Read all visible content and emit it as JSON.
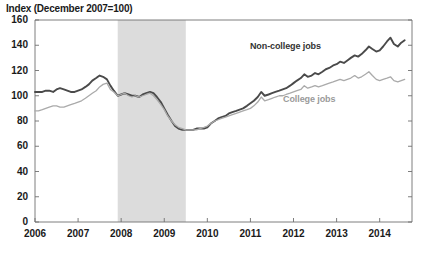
{
  "chart_data": {
    "type": "line",
    "title": "Index (December 2007=100)",
    "xlabel": "",
    "ylabel": "Index (December 2007=100)",
    "ylim": [
      0,
      160
    ],
    "xlim": [
      2006.0,
      2014.75
    ],
    "grid": false,
    "legend_position": "inline-annotation",
    "yticks": [
      0,
      20,
      40,
      60,
      80,
      100,
      120,
      140,
      160
    ],
    "ytick_labels": [
      "0",
      "20",
      "40",
      "60",
      "80",
      "100",
      "120",
      "140",
      "160"
    ],
    "xticks": [
      2006,
      2007,
      2008,
      2009,
      2010,
      2011,
      2012,
      2013,
      2014
    ],
    "xtick_labels": [
      "2006",
      "2007",
      "2008",
      "2009",
      "2010",
      "2011",
      "2012",
      "2013",
      "2014"
    ],
    "annotations": [
      {
        "text": "Non-college jobs",
        "x": 2012.15,
        "y": 139,
        "color": "#333333"
      },
      {
        "text": "College jobs",
        "x": 2012.5,
        "y": 97,
        "color": "#9a9a9a"
      }
    ],
    "shaded_regions": [
      {
        "name": "recession",
        "x_start": 2007.92,
        "x_end": 2009.5,
        "color": "#dcdcdc"
      }
    ],
    "series": [
      {
        "name": "Non-college jobs",
        "color": "#4a4a4a",
        "x": [
          2006.0,
          2006.08,
          2006.17,
          2006.25,
          2006.33,
          2006.42,
          2006.5,
          2006.58,
          2006.67,
          2006.75,
          2006.83,
          2006.92,
          2007.0,
          2007.08,
          2007.17,
          2007.25,
          2007.33,
          2007.42,
          2007.5,
          2007.58,
          2007.67,
          2007.75,
          2007.83,
          2007.92,
          2008.0,
          2008.08,
          2008.17,
          2008.25,
          2008.33,
          2008.42,
          2008.5,
          2008.58,
          2008.67,
          2008.75,
          2008.83,
          2008.92,
          2009.0,
          2009.08,
          2009.17,
          2009.25,
          2009.33,
          2009.42,
          2009.5,
          2009.58,
          2009.67,
          2009.75,
          2009.83,
          2009.92,
          2010.0,
          2010.08,
          2010.17,
          2010.25,
          2010.33,
          2010.42,
          2010.5,
          2010.58,
          2010.67,
          2010.75,
          2010.83,
          2010.92,
          2011.0,
          2011.08,
          2011.17,
          2011.25,
          2011.33,
          2011.42,
          2011.5,
          2011.58,
          2011.67,
          2011.75,
          2011.83,
          2011.92,
          2012.0,
          2012.08,
          2012.17,
          2012.25,
          2012.33,
          2012.42,
          2012.5,
          2012.58,
          2012.67,
          2012.75,
          2012.83,
          2012.92,
          2013.0,
          2013.08,
          2013.17,
          2013.25,
          2013.33,
          2013.42,
          2013.5,
          2013.58,
          2013.67,
          2013.75,
          2013.83,
          2013.92,
          2014.0,
          2014.08,
          2014.17,
          2014.25,
          2014.33,
          2014.42,
          2014.5,
          2014.58
        ],
        "values": [
          103,
          103,
          103,
          104,
          104,
          103,
          105,
          106,
          105,
          104,
          103,
          103,
          104,
          105,
          107,
          109,
          112,
          114,
          116,
          115,
          113,
          108,
          104,
          100,
          101,
          102,
          101,
          100,
          100,
          99,
          101,
          102,
          103,
          102,
          99,
          95,
          90,
          85,
          80,
          76,
          74,
          73,
          73,
          73,
          73,
          74,
          74,
          74,
          75,
          78,
          80,
          82,
          83,
          84,
          86,
          87,
          88,
          89,
          90,
          92,
          94,
          96,
          99,
          103,
          100,
          101,
          102,
          103,
          104,
          105,
          106,
          108,
          110,
          112,
          114,
          117,
          115,
          116,
          118,
          117,
          119,
          121,
          122,
          124,
          125,
          127,
          126,
          128,
          130,
          132,
          131,
          133,
          136,
          139,
          137,
          135,
          136,
          139,
          143,
          146,
          141,
          139,
          142,
          144
        ]
      },
      {
        "name": "College jobs",
        "color": "#aaaaaa",
        "x": [
          2006.0,
          2006.08,
          2006.17,
          2006.25,
          2006.33,
          2006.42,
          2006.5,
          2006.58,
          2006.67,
          2006.75,
          2006.83,
          2006.92,
          2007.0,
          2007.08,
          2007.17,
          2007.25,
          2007.33,
          2007.42,
          2007.5,
          2007.58,
          2007.67,
          2007.75,
          2007.83,
          2007.92,
          2008.0,
          2008.08,
          2008.17,
          2008.25,
          2008.33,
          2008.42,
          2008.5,
          2008.58,
          2008.67,
          2008.75,
          2008.83,
          2008.92,
          2009.0,
          2009.08,
          2009.17,
          2009.25,
          2009.33,
          2009.42,
          2009.5,
          2009.58,
          2009.67,
          2009.75,
          2009.83,
          2009.92,
          2010.0,
          2010.08,
          2010.17,
          2010.25,
          2010.33,
          2010.42,
          2010.5,
          2010.58,
          2010.67,
          2010.75,
          2010.83,
          2010.92,
          2011.0,
          2011.08,
          2011.17,
          2011.25,
          2011.33,
          2011.42,
          2011.5,
          2011.58,
          2011.67,
          2011.75,
          2011.83,
          2011.92,
          2012.0,
          2012.08,
          2012.17,
          2012.25,
          2012.33,
          2012.42,
          2012.5,
          2012.58,
          2012.67,
          2012.75,
          2012.83,
          2012.92,
          2013.0,
          2013.08,
          2013.17,
          2013.25,
          2013.33,
          2013.42,
          2013.5,
          2013.58,
          2013.67,
          2013.75,
          2013.83,
          2013.92,
          2014.0,
          2014.08,
          2014.17,
          2014.25,
          2014.33,
          2014.42,
          2014.5,
          2014.58
        ],
        "values": [
          88,
          88,
          89,
          90,
          91,
          92,
          92,
          91,
          91,
          92,
          93,
          94,
          95,
          96,
          98,
          100,
          102,
          104,
          107,
          109,
          110,
          105,
          103,
          100,
          101,
          102,
          100,
          99,
          100,
          99,
          100,
          101,
          102,
          100,
          97,
          93,
          89,
          84,
          80,
          77,
          75,
          74,
          73,
          73,
          73,
          73,
          74,
          75,
          76,
          78,
          80,
          81,
          82,
          83,
          84,
          85,
          86,
          87,
          88,
          89,
          90,
          92,
          95,
          99,
          96,
          97,
          98,
          99,
          100,
          100,
          101,
          102,
          103,
          104,
          105,
          108,
          106,
          107,
          108,
          107,
          108,
          109,
          110,
          111,
          112,
          113,
          112,
          113,
          114,
          116,
          114,
          115,
          117,
          119,
          116,
          113,
          112,
          113,
          114,
          115,
          112,
          111,
          112,
          113
        ]
      }
    ]
  }
}
